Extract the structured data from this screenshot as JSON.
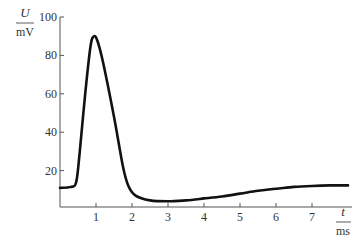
{
  "chart_data": {
    "type": "line",
    "title": "",
    "xlabel": "t / ms",
    "ylabel": "U / mV",
    "x_label_var": "t",
    "x_label_unit": "ms",
    "y_label_var": "U",
    "y_label_unit": "mV",
    "xlim": [
      0,
      8
    ],
    "ylim": [
      0,
      100
    ],
    "x_ticks": [
      1,
      2,
      3,
      4,
      5,
      6,
      7
    ],
    "y_ticks": [
      20,
      40,
      60,
      80,
      100
    ],
    "grid": false,
    "legend": null,
    "series": [
      {
        "name": "U(t)",
        "color": "#111111",
        "x": [
          0,
          0.3,
          0.45,
          0.55,
          0.7,
          0.85,
          0.95,
          1.05,
          1.2,
          1.5,
          1.75,
          1.9,
          2.1,
          2.5,
          3.0,
          3.5,
          4.0,
          4.5,
          5.0,
          5.5,
          6.0,
          6.5,
          7.0,
          7.5,
          8.0
        ],
        "values": [
          11,
          11.5,
          14,
          30,
          60,
          85,
          90,
          87,
          76,
          48,
          22,
          12,
          7,
          4.5,
          4,
          4.5,
          5.5,
          6.5,
          8,
          9.5,
          10.5,
          11.5,
          12,
          12.3,
          12.3
        ]
      }
    ],
    "annotations": []
  }
}
